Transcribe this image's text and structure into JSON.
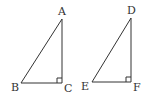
{
  "diagram": {
    "triangles": [
      {
        "name": "ABC",
        "vertices": {
          "A": {
            "label": "A",
            "x": 62,
            "y": 19
          },
          "B": {
            "label": "B",
            "x": 21,
            "y": 83
          },
          "C": {
            "label": "C",
            "x": 62,
            "y": 83
          }
        },
        "right_angle_at": "C"
      },
      {
        "name": "DEF",
        "vertices": {
          "D": {
            "label": "D",
            "x": 131,
            "y": 18
          },
          "E": {
            "label": "E",
            "x": 92,
            "y": 82
          },
          "F": {
            "label": "F",
            "x": 131,
            "y": 82
          }
        },
        "right_angle_at": "F"
      }
    ],
    "labels": {
      "A": "A",
      "B": "B",
      "C": "C",
      "D": "D",
      "E": "E",
      "F": "F"
    },
    "colors": {
      "stroke": "#333333",
      "background": "#ffffff"
    }
  }
}
